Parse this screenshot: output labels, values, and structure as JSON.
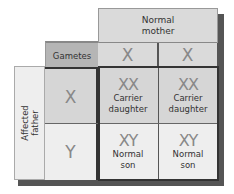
{
  "header": {
    "mother_label_line1": "Normal",
    "mother_label_line2": "mother"
  },
  "gametes_label": "Gametes",
  "mother_gametes": [
    "X",
    "X"
  ],
  "father": {
    "label_line1": "Affected",
    "label_line2": "father",
    "gametes": [
      "X",
      "Y"
    ]
  },
  "offspring": [
    [
      {
        "genotype": "XX",
        "phenotype_line1": "Carrier",
        "phenotype_line2": "daughter"
      },
      {
        "genotype": "XX",
        "phenotype_line1": "Carrier",
        "phenotype_line2": "daughter"
      }
    ],
    [
      {
        "genotype": "XY",
        "phenotype_line1": "Normal",
        "phenotype_line2": "son"
      },
      {
        "genotype": "XY",
        "phenotype_line1": "Normal",
        "phenotype_line2": "son"
      }
    ]
  ],
  "colors": {
    "header_bg": "#dadada",
    "gametes_bg": "#b5b5b5",
    "x_row_bg": "#d6d6d6",
    "y_row_bg": "#eeeeee",
    "symbol_color": "#888888",
    "shadow": "#555555"
  }
}
